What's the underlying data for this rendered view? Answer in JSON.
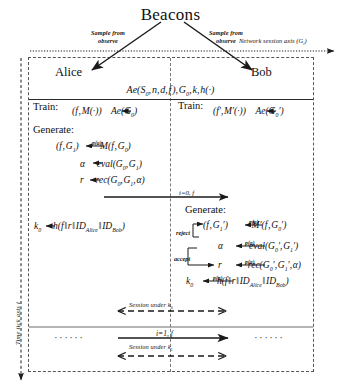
{
  "diagram": {
    "title": "Beacons",
    "axes": {
      "network_axis_label": "Network session axis (Gi)",
      "time_axis_label": "Time tick axis i"
    },
    "beacon_arrows": [
      {
        "name": "left",
        "label_line1": "Sample from",
        "label_line2": "observe"
      },
      {
        "name": "right",
        "label_line1": "Sample from",
        "label_line2": "observe"
      }
    ],
    "parties": {
      "left": "Alice",
      "right": "Bob"
    },
    "shared_params": "Ae(S0, n, d, f), G0, k, h(·)",
    "left_column": {
      "train_keyword": "Train:",
      "train_equation": "(f, M(·)) ← Ae(G0)",
      "generate_keyword": "Generate:",
      "generate_lines": [
        "(f, G1) ← p(a) — M(f, G0)",
        "α ← eval(G0, G1)",
        "r ← rec(G0, G1, α)"
      ],
      "key_line": "k0 ← h(f ‖ r ‖ IDAlice ‖ IDBob)"
    },
    "right_column": {
      "train_keyword": "Train:",
      "train_equation": "(f′, M′(·)) ← Ae(G0′)",
      "generate_keyword": "Generate:",
      "generate_lines": [
        "(f, G1′) ← p(a) — M′(f, G0′)",
        "α ← p(a) — eval(G0′, G1′)",
        "r ← p(a) — rec(G0′, G1′, α)"
      ],
      "branch_reject": "reject",
      "branch_accept": "accept",
      "key_line": "k0 ← p(a) — h(f ‖ r ‖ IDAlice ‖ IDBob)"
    },
    "transfer_arrows": [
      {
        "name": "tick-0",
        "label": "i=0, f"
      },
      {
        "name": "tick-1",
        "label": "i=1, f"
      }
    ],
    "session_bars": [
      {
        "name": "session-k0",
        "label": "Session under k0"
      },
      {
        "name": "session-k1",
        "label": "Session under k1"
      }
    ],
    "ellipses": {
      "left": "······",
      "right": "······"
    },
    "colors": {
      "ink": "#111111",
      "dashed_border": "#555555",
      "lifeline": "#777777",
      "rule": "#2b2b2b"
    }
  }
}
